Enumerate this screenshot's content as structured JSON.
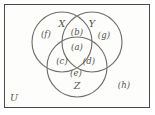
{
  "figure": {
    "type": "venn-diagram-3set",
    "universe_label": "U",
    "background_color": "#fdfdfc",
    "border_color": "#4a4a4a",
    "circle_stroke_color": "#6f6f6f",
    "text_color": "#55504e"
  },
  "sets": [
    {
      "id": "X",
      "label": "X",
      "cx": 62,
      "cy": 42,
      "r": 30,
      "label_x": 62,
      "label_y": 24
    },
    {
      "id": "Y",
      "label": "Y",
      "cx": 92,
      "cy": 42,
      "r": 30,
      "label_x": 92,
      "label_y": 24
    },
    {
      "id": "Z",
      "label": "Z",
      "cx": 77,
      "cy": 67,
      "r": 30,
      "label_x": 77,
      "label_y": 86
    }
  ],
  "regions": [
    {
      "id": "a",
      "label": "(a)",
      "meaning": "X and Y and Z",
      "x": 77,
      "y": 47
    },
    {
      "id": "b",
      "label": "(b)",
      "meaning": "X and Y only",
      "x": 77,
      "y": 32
    },
    {
      "id": "c",
      "label": "(c)",
      "meaning": "X and Z only",
      "x": 62,
      "y": 61
    },
    {
      "id": "d",
      "label": "(d)",
      "meaning": "Y and Z only",
      "x": 89,
      "y": 61
    },
    {
      "id": "e",
      "label": "(e)",
      "meaning": "Z only",
      "x": 76,
      "y": 73
    },
    {
      "id": "f",
      "label": "(f)",
      "meaning": "X only",
      "x": 46,
      "y": 34
    },
    {
      "id": "g",
      "label": "(g)",
      "meaning": "Y only",
      "x": 104,
      "y": 35
    },
    {
      "id": "h",
      "label": "(h)",
      "meaning": "outside all sets",
      "x": 124,
      "y": 85
    }
  ],
  "universe": {
    "label": "U",
    "x": 14,
    "y": 98
  }
}
